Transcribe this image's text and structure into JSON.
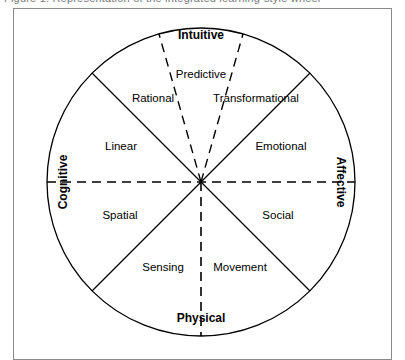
{
  "figure": {
    "cut_caption_fragment": "Figure 1.  Representation of the integrated learning-style wheel",
    "frame_color": "#8b8b8b",
    "line_color": "#000000",
    "background": "#ffffff"
  },
  "diagram": {
    "type": "wheel",
    "center": {
      "x": 201,
      "y": 182
    },
    "radius": 154,
    "axis_labels": [
      {
        "name": "cognitive",
        "text": "Cognitive",
        "position": "left",
        "orientation": "vertical-up",
        "bold": true
      },
      {
        "name": "affective",
        "text": "Affective",
        "position": "right",
        "orientation": "vertical-down",
        "bold": true
      },
      {
        "name": "intuitive",
        "text": "Intuitive",
        "position": "top",
        "orientation": "horizontal",
        "bold": true
      },
      {
        "name": "physical",
        "text": "Physical",
        "position": "bottom",
        "orientation": "horizontal",
        "bold": true
      }
    ],
    "sector_labels": [
      {
        "name": "predictive",
        "text": "Predictive",
        "x": 201,
        "y": 75
      },
      {
        "name": "rational",
        "text": "Rational",
        "x": 153,
        "y": 99
      },
      {
        "name": "transformational",
        "text": "Transformational",
        "x": 256,
        "y": 99
      },
      {
        "name": "linear",
        "text": "Linear",
        "x": 121,
        "y": 147
      },
      {
        "name": "emotional",
        "text": "Emotional",
        "x": 281,
        "y": 147
      },
      {
        "name": "spatial",
        "text": "Spatial",
        "x": 120,
        "y": 216
      },
      {
        "name": "social",
        "text": "Social",
        "x": 278,
        "y": 216
      },
      {
        "name": "sensing",
        "text": "Sensing",
        "x": 163,
        "y": 268
      },
      {
        "name": "movement",
        "text": "Movement",
        "x": 240,
        "y": 268
      }
    ],
    "dividers": [
      {
        "name": "horizontal-axis",
        "style": "dashed",
        "angle_deg": 0,
        "full_diameter": true
      },
      {
        "name": "vertical-lower-axis",
        "style": "dashed",
        "angle_deg": 90,
        "full_diameter": false
      },
      {
        "name": "diagonal-nw-se",
        "style": "solid",
        "angle_deg": 45,
        "full_diameter": true
      },
      {
        "name": "diagonal-ne-sw",
        "style": "solid",
        "angle_deg": 135,
        "full_diameter": true
      },
      {
        "name": "intuitive-left-boundary",
        "style": "dashed",
        "angle_deg": 106,
        "full_diameter": false
      },
      {
        "name": "intuitive-right-boundary",
        "style": "dashed",
        "angle_deg": 74,
        "full_diameter": false
      }
    ]
  }
}
